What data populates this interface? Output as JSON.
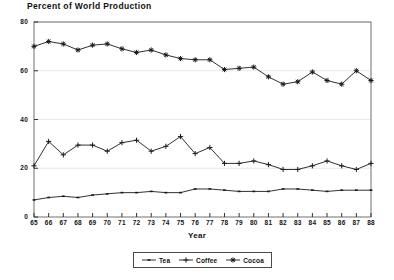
{
  "chart_data": {
    "type": "line",
    "title": "Percent of World Production",
    "xlabel": "Year",
    "ylabel": "",
    "xlim": [
      65,
      88
    ],
    "ylim": [
      0,
      80
    ],
    "yticks": [
      0,
      20,
      40,
      60,
      80
    ],
    "grid": true,
    "legend_position": "bottom",
    "x": [
      65,
      66,
      67,
      68,
      69,
      70,
      71,
      72,
      73,
      74,
      75,
      76,
      77,
      78,
      79,
      80,
      81,
      82,
      83,
      84,
      85,
      86,
      87,
      88
    ],
    "categories": [
      "65",
      "66",
      "67",
      "68",
      "69",
      "70",
      "71",
      "72",
      "73",
      "74",
      "75",
      "76",
      "77",
      "78",
      "79",
      "80",
      "81",
      "82",
      "83",
      "84",
      "85",
      "86",
      "87",
      "88"
    ],
    "series": [
      {
        "name": "Tea",
        "marker": "dash",
        "color": "#1a1a1a",
        "values": [
          7,
          8,
          8.5,
          8,
          9,
          9.5,
          10,
          10,
          10.5,
          10,
          10,
          11.5,
          11.5,
          11,
          10.5,
          10.5,
          10.5,
          11.5,
          11.5,
          11,
          10.5,
          11,
          11,
          11
        ]
      },
      {
        "name": "Coffee",
        "marker": "plus",
        "color": "#1a1a1a",
        "values": [
          21,
          31,
          25.5,
          29.5,
          29.5,
          27,
          30.5,
          31.5,
          27,
          29,
          33,
          26,
          28.5,
          22,
          22,
          23,
          21.5,
          19.5,
          19.5,
          21,
          23,
          21,
          19.5,
          22
        ]
      },
      {
        "name": "Cocoa",
        "marker": "asterisk",
        "color": "#1a1a1a",
        "values": [
          70,
          72,
          71,
          68.5,
          70.5,
          71,
          69,
          67.5,
          68.5,
          66.5,
          65,
          64.5,
          64.5,
          60.5,
          61,
          61.5,
          57.5,
          54.5,
          55.5,
          59.5,
          56,
          54.5,
          60,
          56
        ]
      }
    ]
  },
  "legend": {
    "entries": [
      {
        "label": "Tea",
        "marker": "dash"
      },
      {
        "label": "Coffee",
        "marker": "plus"
      },
      {
        "label": "Cocoa",
        "marker": "asterisk"
      }
    ]
  }
}
